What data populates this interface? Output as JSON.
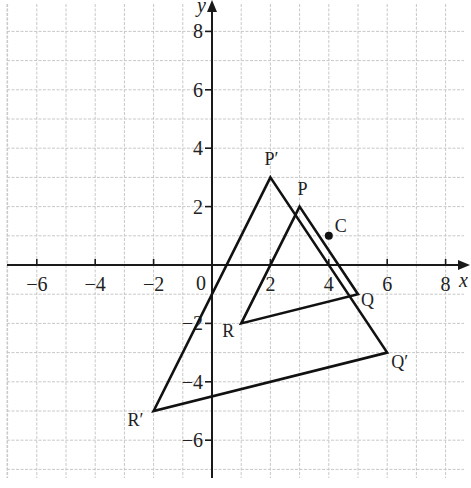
{
  "chart_data": {
    "type": "diagram",
    "title": "",
    "xlabel": "x",
    "ylabel": "y",
    "xlim": [
      -7,
      9
    ],
    "ylim": [
      -7,
      9
    ],
    "grid": true,
    "x_ticks": [
      -6,
      -4,
      -2,
      0,
      2,
      4,
      6,
      8
    ],
    "y_ticks": [
      -6,
      -4,
      -2,
      2,
      4,
      6,
      8
    ],
    "tick_labels": {
      "x": [
        "−6",
        "−4",
        "−2",
        "0",
        "2",
        "4",
        "6",
        "8"
      ],
      "y": [
        "−6",
        "−4",
        "−2",
        "2",
        "4",
        "6",
        "8"
      ]
    },
    "shapes": [
      {
        "name": "PQR",
        "vertices": [
          {
            "label": "P",
            "x": 3,
            "y": 2
          },
          {
            "label": "Q",
            "x": 5,
            "y": -1
          },
          {
            "label": "R",
            "x": 1,
            "y": -2
          }
        ]
      },
      {
        "name": "P'Q'R'",
        "vertices": [
          {
            "label": "P′",
            "x": 2,
            "y": 3
          },
          {
            "label": "Q′",
            "x": 6,
            "y": -3
          },
          {
            "label": "R′",
            "x": -2,
            "y": -5
          }
        ]
      }
    ],
    "points": [
      {
        "label": "C",
        "x": 4,
        "y": 1
      }
    ]
  },
  "labels": {
    "x_axis": "x",
    "y_axis": "y",
    "origin": "0",
    "P": "P",
    "Q": "Q",
    "R": "R",
    "P_prime": "P′",
    "Q_prime": "Q′",
    "R_prime": "R′",
    "C": "C"
  },
  "colors": {
    "grid": "#c8c8c8",
    "axes": "#1a1a1a",
    "shapes": "#111111",
    "background": "#ffffff"
  }
}
